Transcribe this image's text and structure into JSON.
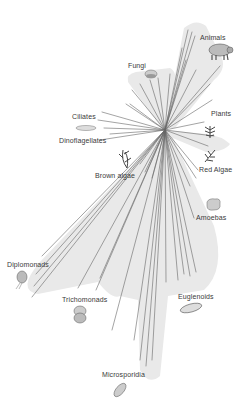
{
  "diagram": {
    "type": "unrooted phylogenetic tree of eukaryotes",
    "colors": {
      "shade": "#e8e8e8",
      "branch": "#666666",
      "label": "#3a3a3a"
    },
    "groups": [
      {
        "id": "animals",
        "label": "Animals",
        "icon": "pig-icon"
      },
      {
        "id": "fungi",
        "label": "Fungi",
        "icon": "mushroom-icon"
      },
      {
        "id": "plants",
        "label": "Plants",
        "icon": "plant-icon"
      },
      {
        "id": "ciliates",
        "label": "Ciliates",
        "icon": "ciliate-icon"
      },
      {
        "id": "dinoflagellates",
        "label": "Dinoflagellates",
        "icon": null
      },
      {
        "id": "brown_algae",
        "label": "Brown algae",
        "icon": "seaweed-icon"
      },
      {
        "id": "red_algae",
        "label": "Red Algae",
        "icon": "red-algae-icon"
      },
      {
        "id": "amoebas",
        "label": "Amoebas",
        "icon": "amoeba-icon"
      },
      {
        "id": "diplomonads",
        "label": "Diplomonads",
        "icon": "diplomonad-icon"
      },
      {
        "id": "trichomonads",
        "label": "Trichomonads",
        "icon": "trichomonad-icon"
      },
      {
        "id": "euglenoids",
        "label": "Euglenoids",
        "icon": "euglenoid-icon"
      },
      {
        "id": "microsporidia",
        "label": "Microsporidia",
        "icon": "microsporidia-icon"
      }
    ]
  }
}
